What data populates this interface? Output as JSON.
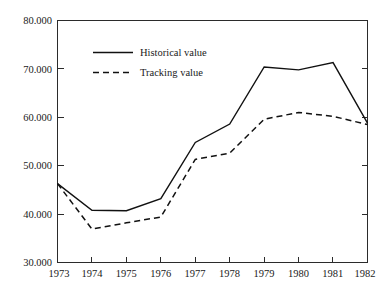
{
  "chart_data": {
    "type": "line",
    "title": "",
    "subtitle": "",
    "xlabel": "",
    "ylabel": "",
    "categories": [
      "1973",
      "1974",
      "1975",
      "1976",
      "1977",
      "1978",
      "1979",
      "1980",
      "1981",
      "1982"
    ],
    "x": [
      1973,
      1974,
      1975,
      1976,
      1977,
      1978,
      1979,
      1980,
      1981,
      1982
    ],
    "series": [
      {
        "name": "Historical value",
        "style": "solid",
        "color": "#111111",
        "values": [
          46300,
          40800,
          40700,
          43200,
          54800,
          58600,
          70400,
          69800,
          71300,
          58800
        ]
      },
      {
        "name": "Tracking value",
        "style": "dashed",
        "color": "#111111",
        "values": [
          46300,
          36900,
          38200,
          39400,
          51300,
          52600,
          59600,
          61000,
          60200,
          58500
        ]
      }
    ],
    "ylim": [
      30000,
      80000
    ],
    "ytick_values": [
      30000,
      40000,
      50000,
      60000,
      70000,
      80000
    ],
    "ytick_labels": [
      "30.000",
      "40.000",
      "50.000",
      "60.000",
      "70.000",
      "80.000"
    ],
    "xtick_labels": [
      "1973",
      "1974",
      "1975",
      "1976",
      "1977",
      "1978",
      "1979",
      "1980",
      "1981",
      "1982"
    ],
    "grid": false,
    "legend_position": "upper-left-inside",
    "legend_entries": [
      "Historical value",
      "Tracking value"
    ],
    "axis_color": "#2b2b2b",
    "background_color": "#ffffff",
    "frame": "box",
    "ticks_both_sides": true,
    "annotations": []
  }
}
